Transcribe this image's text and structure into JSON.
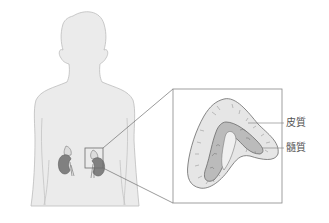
{
  "figure": {
    "labels": [
      {
        "id": "cortex",
        "text": "皮質"
      },
      {
        "id": "medulla",
        "text": "髓質"
      }
    ]
  },
  "colors": {
    "body_fill": "#ebebeb",
    "body_stroke": "#b9b9b9",
    "kidney": "#7d7d7d",
    "line": "#707070",
    "cortex_fill": "#e4e4e4",
    "medulla_fill": "#b8b8b8"
  }
}
